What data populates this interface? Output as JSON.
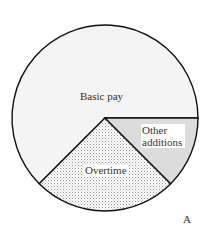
{
  "chart_data": {
    "type": "pie",
    "title": "",
    "panel_label": "A",
    "categories": [
      "Basic pay",
      "Overtime",
      "Other additions"
    ],
    "values": [
      62.5,
      25,
      12.5
    ],
    "unit": "percent (estimated from slice angles)",
    "slices": [
      {
        "label": "Basic pay",
        "value": 62.5,
        "start_deg": 135,
        "end_deg": 360,
        "fill": "#f4f4f4",
        "pattern": "none"
      },
      {
        "label": "Overtime",
        "value": 25,
        "start_deg": 45,
        "end_deg": 135,
        "fill": "#ffffff",
        "pattern": "stipple"
      },
      {
        "label": "Other additions",
        "value": 12.5,
        "start_deg": 0,
        "end_deg": 45,
        "fill": "#dcdcdc",
        "pattern": "none"
      }
    ],
    "legend": "none (labels inside slices)",
    "colors": {
      "outline": "#111111",
      "text": "#333333"
    }
  },
  "labels": {
    "basic_pay": "Basic pay",
    "overtime": "Overtime",
    "other_additions": "Other additions",
    "panel": "A"
  }
}
